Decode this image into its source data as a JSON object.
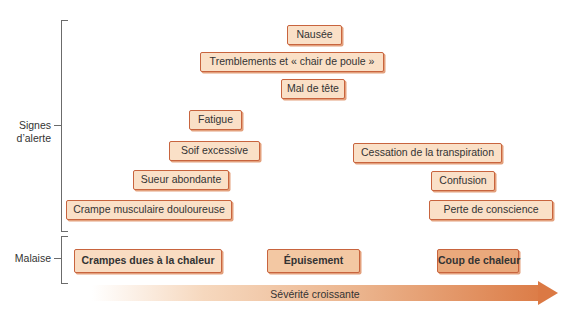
{
  "groups": {
    "warning_signs": "Signes\nd’alerte",
    "warning_signs_line1": "Signes",
    "warning_signs_line2": "d’alerte",
    "illness": "Malaise"
  },
  "symptoms": {
    "heat_cramps": [
      "Crampe musculaire douloureuse",
      "Sueur abondante"
    ],
    "heat_exhaustion": [
      "Soif excessive",
      "Fatigue",
      "Mal de tête",
      "Tremblements et « chair de poule »",
      "Nausée"
    ],
    "heat_stroke": [
      "Cessation de la transpiration",
      "Confusion",
      "Perte de conscience"
    ]
  },
  "conditions": [
    "Crampes dues à la chaleur",
    "Épuisement",
    "Coup de chaleur"
  ],
  "axis": {
    "label": "Sévérité croissante"
  },
  "colors": {
    "box_fill": "#fae0c7",
    "box_border": "#c8643e",
    "arrow_end": "#db7944"
  }
}
